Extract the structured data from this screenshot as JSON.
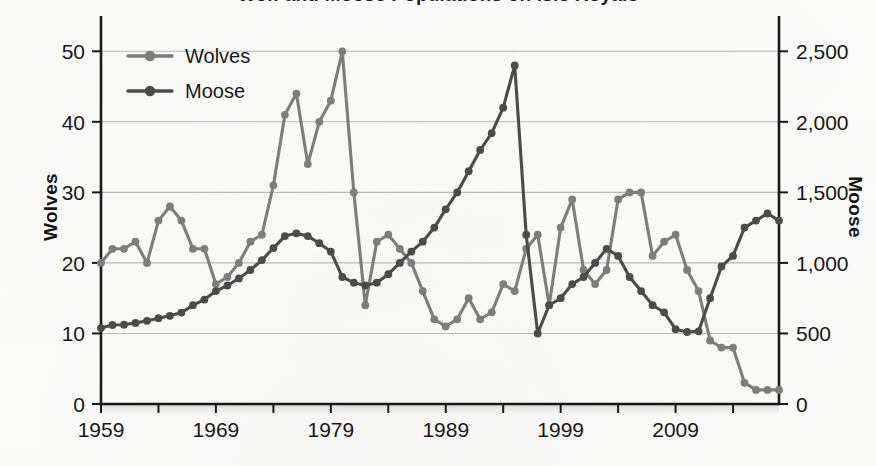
{
  "chart": {
    "title": "Wolf and Moose Populations on Isle Royale",
    "y_left_label": "Wolves",
    "y_right_label": "Moose"
  },
  "legend": {
    "position": "top-left",
    "entries": [
      {
        "label": "Wolves",
        "color": "#7d7d7d"
      },
      {
        "label": "Moose",
        "color": "#4b4b4b"
      }
    ]
  },
  "axes": {
    "left_ticks": [
      "0",
      "10",
      "20",
      "30",
      "40",
      "50"
    ],
    "right_ticks": [
      "0",
      "500",
      "1,000",
      "1,500",
      "2,000",
      "2,500"
    ],
    "x_ticks": [
      "1959",
      "1969",
      "1979",
      "1989",
      "1999",
      "2009"
    ]
  },
  "chart_data": {
    "type": "line",
    "title": "Wolf and Moose Populations on Isle Royale",
    "xlabel": "",
    "ylabel": "Wolves",
    "y2label": "Moose",
    "xlim": [
      1959,
      2018
    ],
    "ylim": [
      0,
      55
    ],
    "y2lim": [
      0,
      2750
    ],
    "grid": true,
    "legend_position": "top-left",
    "x": [
      1959,
      1960,
      1961,
      1962,
      1963,
      1964,
      1965,
      1966,
      1967,
      1968,
      1969,
      1970,
      1971,
      1972,
      1973,
      1974,
      1975,
      1976,
      1977,
      1978,
      1979,
      1980,
      1981,
      1982,
      1983,
      1984,
      1985,
      1986,
      1987,
      1988,
      1989,
      1990,
      1991,
      1992,
      1993,
      1994,
      1995,
      1996,
      1997,
      1998,
      1999,
      2000,
      2001,
      2002,
      2003,
      2004,
      2005,
      2006,
      2007,
      2008,
      2009,
      2010,
      2011,
      2012,
      2013,
      2014,
      2015,
      2016,
      2017,
      2018
    ],
    "series": [
      {
        "name": "Wolves",
        "axis": "left",
        "color": "#7d7d7d",
        "values": [
          20,
          22,
          22,
          23,
          20,
          26,
          28,
          26,
          22,
          22,
          17,
          18,
          20,
          23,
          24,
          31,
          41,
          44,
          34,
          40,
          43,
          50,
          30,
          14,
          23,
          24,
          22,
          20,
          16,
          12,
          11,
          12,
          15,
          12,
          13,
          17,
          16,
          22,
          24,
          14,
          25,
          29,
          19,
          17,
          19,
          29,
          30,
          30,
          21,
          23,
          24,
          19,
          16,
          9,
          8,
          8,
          3,
          2,
          2,
          2
        ]
      },
      {
        "name": "Moose",
        "axis": "right",
        "color": "#4b4b4b",
        "values": [
          538,
          560,
          562,
          575,
          590,
          608,
          625,
          648,
          700,
          740,
          800,
          840,
          890,
          950,
          1020,
          1105,
          1190,
          1210,
          1190,
          1140,
          1080,
          900,
          860,
          840,
          860,
          920,
          1000,
          1080,
          1150,
          1250,
          1380,
          1500,
          1650,
          1800,
          1920,
          2100,
          2400,
          1200,
          500,
          700,
          750,
          850,
          900,
          1000,
          1100,
          1050,
          900,
          800,
          700,
          650,
          530,
          510,
          515,
          750,
          975,
          1050,
          1250,
          1300,
          1350,
          1300
        ]
      }
    ]
  }
}
